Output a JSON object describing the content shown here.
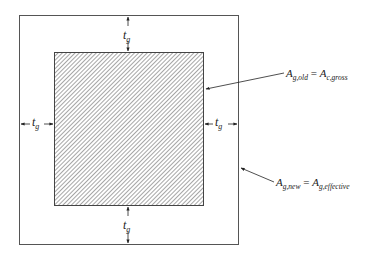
{
  "diagram": {
    "outer_box": {
      "x": 19,
      "y": 15,
      "w": 219,
      "h": 229,
      "stroke": "#555555"
    },
    "inner_box": {
      "x": 54,
      "y": 52,
      "w": 149,
      "h": 153,
      "stroke": "#444444",
      "hatch": "#666666"
    },
    "dimension_symbol": {
      "base": "t",
      "sub": "g"
    },
    "labels": {
      "old_area": {
        "lhs_base": "A",
        "lhs_sub": "g,old",
        "eq": " = ",
        "rhs_base": "A",
        "rhs_sub": "c,gross"
      },
      "new_area": {
        "lhs_base": "A",
        "lhs_sub": "g,new",
        "eq": " = ",
        "rhs_base": "A",
        "rhs_sub": "g,effective"
      }
    }
  }
}
